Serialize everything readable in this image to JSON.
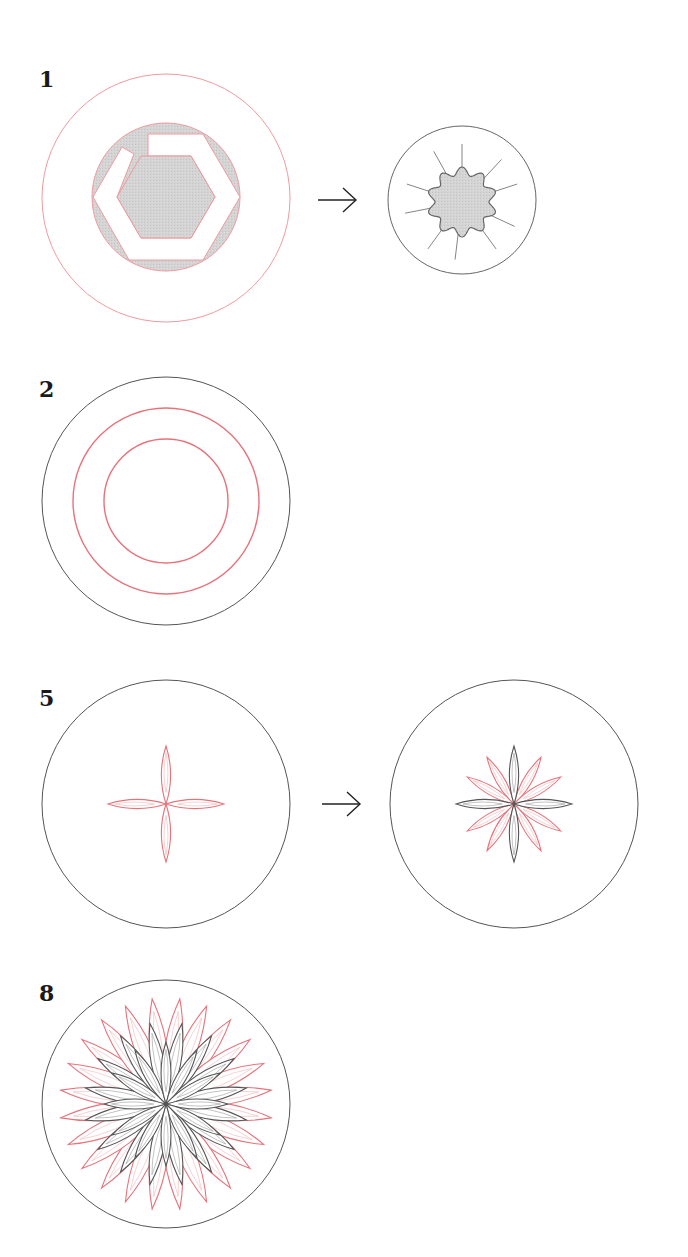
{
  "colors": {
    "background": "#ffffff",
    "black_line": "#555555",
    "red_line": "#e8727a",
    "light_red_line": "#f2b3b7",
    "fill_gray": "#d2d2d2",
    "label": "#1a1a1a"
  },
  "steps": [
    {
      "label": "1",
      "label_pos": [
        40,
        68
      ],
      "circle": {
        "cx": 166,
        "cy": 198,
        "r": 124,
        "stroke": "red"
      },
      "content": "hexagonal-nut-in-disc",
      "arrow": {
        "x1": 318,
        "x2": 356,
        "y": 200
      },
      "result": {
        "cx": 462,
        "cy": 200,
        "r": 74,
        "content": "wavy-10-point-star-with-rays"
      }
    },
    {
      "label": "2",
      "label_pos": [
        40,
        378
      ],
      "circle": {
        "cx": 166,
        "cy": 501,
        "r": 124,
        "stroke": "black"
      },
      "rings": [
        93,
        62
      ],
      "content": "concentric-red-rings"
    },
    {
      "label": "5",
      "label_pos": [
        40,
        687
      ],
      "circle": {
        "cx": 166,
        "cy": 804,
        "r": 124,
        "stroke": "black"
      },
      "content": "4-petal-rose",
      "petal_length": 58,
      "arrow": {
        "x1": 322,
        "x2": 360,
        "y": 804
      },
      "result": {
        "cx": 514,
        "cy": 804,
        "r": 124,
        "content": "12-petal-rose",
        "black_petal_length": 58,
        "red_petal_length": 54
      }
    },
    {
      "label": "8",
      "label_pos": [
        40,
        982
      ],
      "circle": {
        "cx": 166,
        "cy": 1104,
        "r": 124,
        "stroke": "black"
      },
      "content": "multi-layer-chrysanthemum",
      "layers": [
        {
          "count": 24,
          "length": 106,
          "color": "red",
          "offset_deg": 7.5
        },
        {
          "count": 16,
          "length": 82,
          "color": "black",
          "offset_deg": 11.25
        },
        {
          "count": 12,
          "length": 62,
          "color": "black",
          "offset_deg": 0
        }
      ]
    }
  ]
}
